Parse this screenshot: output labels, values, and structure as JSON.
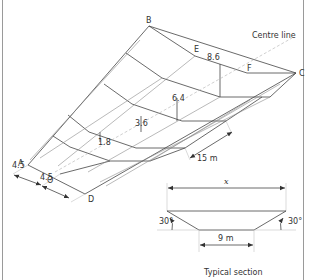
{
  "diagram": {
    "title_partial": "",
    "points": {
      "A": "A",
      "B": "B",
      "C": "C",
      "D": "D",
      "E": "E",
      "F": "F",
      "O": "O"
    },
    "centre_line_label": "Centre line",
    "heights": [
      "1.8",
      "3.6",
      "6.4",
      "8.6"
    ],
    "half_widths": [
      "4.5",
      "4.5"
    ],
    "interval_label": "15 m",
    "section": {
      "top_width_label": "x",
      "bottom_width_label": "9 m",
      "left_angle": "30°",
      "right_angle": "30°",
      "caption": "Typical section"
    }
  },
  "colors": {
    "line": "#444444",
    "text": "#333333",
    "border": "#9a9a9a"
  }
}
